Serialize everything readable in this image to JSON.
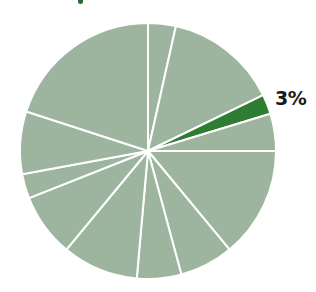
{
  "chart_data": {
    "type": "pie",
    "title": "",
    "start_angle_deg": 0,
    "direction": "clockwise",
    "slices": [
      {
        "value": 3.5,
        "highlight": false,
        "label": ""
      },
      {
        "value": 14.3,
        "highlight": false,
        "label": ""
      },
      {
        "value": 2.5,
        "highlight": true,
        "label": "3%"
      },
      {
        "value": 4.7,
        "highlight": false,
        "label": ""
      },
      {
        "value": 14.0,
        "highlight": false,
        "label": ""
      },
      {
        "value": 6.8,
        "highlight": false,
        "label": ""
      },
      {
        "value": 5.6,
        "highlight": false,
        "label": ""
      },
      {
        "value": 9.6,
        "highlight": false,
        "label": ""
      },
      {
        "value": 8.0,
        "highlight": false,
        "label": ""
      },
      {
        "value": 3.1,
        "highlight": false,
        "label": ""
      },
      {
        "value": 7.9,
        "highlight": false,
        "label": ""
      },
      {
        "value": 20.0,
        "highlight": false,
        "label": ""
      }
    ],
    "annotations": [
      {
        "text": "3%",
        "slice_index": 2
      }
    ],
    "legend": null,
    "colors": {
      "base": "#9db59e",
      "highlight": "#2e7d32",
      "separator": "#ffffff"
    },
    "geometry": {
      "cx": 148,
      "cy": 151,
      "r": 128
    }
  },
  "labels": {
    "highlight_label": "3%"
  }
}
